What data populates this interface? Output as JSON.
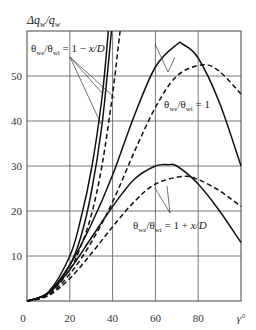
{
  "chart_data": {
    "type": "line",
    "title": "",
    "xlabel": "γ°",
    "ylabel": "Δq_w/q_w",
    "xlim": [
      0,
      100
    ],
    "ylim": [
      0,
      60
    ],
    "grid": true,
    "x_ticks": [
      "0",
      "20",
      "40",
      "60",
      "80",
      "γ°"
    ],
    "y_ticks": [
      "10",
      "20",
      "30",
      "40",
      "50"
    ],
    "legend_position": "none (inline annotations)",
    "annotations": [
      {
        "text": "θwe/θwi = 1 − x/D",
        "points_to": [
          "steep solid A",
          "steep solid B",
          "steep dashed"
        ]
      },
      {
        "text": "θwe/θwi = 1",
        "points_to": [
          "upper solid",
          "upper dashed"
        ]
      },
      {
        "text": "θwe/θwi = 1 + x/D",
        "points_to": [
          "lower solid",
          "lower dashed"
        ]
      }
    ],
    "series": [
      {
        "name": "1 − x/D (solid A)",
        "style": "solid",
        "x": [
          0,
          10,
          20,
          25,
          30,
          35,
          38
        ],
        "y": [
          0,
          2,
          10,
          18,
          29,
          45,
          60
        ]
      },
      {
        "name": "1 − x/D (solid B)",
        "style": "solid",
        "x": [
          0,
          10,
          20,
          25,
          30,
          35,
          39.5
        ],
        "y": [
          0,
          1.8,
          8,
          14,
          24,
          39,
          60
        ]
      },
      {
        "name": "1 − x/D (dashed)",
        "style": "dashed",
        "x": [
          0,
          10,
          20,
          25,
          30,
          35,
          40,
          43.5
        ],
        "y": [
          0,
          1.5,
          7,
          12,
          19,
          30,
          46,
          60
        ]
      },
      {
        "name": "1 (solid)",
        "style": "solid",
        "x": [
          0,
          10,
          20,
          30,
          40,
          50,
          60,
          70,
          73,
          80,
          90,
          100
        ],
        "y": [
          0,
          1.8,
          8,
          17,
          28,
          41,
          52,
          57,
          57,
          54,
          44,
          30
        ]
      },
      {
        "name": "1 (dashed)",
        "style": "dashed",
        "x": [
          0,
          10,
          20,
          30,
          40,
          50,
          60,
          70,
          82,
          90,
          100
        ],
        "y": [
          0,
          1.3,
          6,
          13,
          22,
          33,
          43,
          50,
          52.5,
          51,
          46
        ]
      },
      {
        "name": "1 + x/D (solid)",
        "style": "solid",
        "x": [
          0,
          10,
          20,
          30,
          40,
          50,
          60,
          66,
          70,
          80,
          90,
          100
        ],
        "y": [
          0,
          1.7,
          7,
          14,
          21,
          27,
          30,
          30.3,
          30,
          26,
          20,
          13
        ]
      },
      {
        "name": "1 + x/D (dashed)",
        "style": "dashed",
        "x": [
          0,
          10,
          20,
          30,
          40,
          50,
          60,
          73,
          80,
          90,
          100
        ],
        "y": [
          0,
          1.2,
          5,
          10.5,
          16.5,
          22,
          26,
          27.7,
          27,
          24.5,
          21
        ]
      }
    ]
  },
  "labels": {
    "ylabel": "Δq_w/q_w",
    "ann_top": "θ_we/θ_wi = 1 − x/D",
    "ann_mid": "θ_we/θ_wi = 1",
    "ann_low": "θ_we/θ_wi = 1 + x/D"
  }
}
